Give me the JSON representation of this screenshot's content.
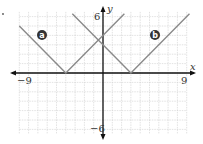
{
  "chart_data": {
    "type": "line",
    "title": "",
    "xlabel": "x",
    "ylabel": "y",
    "xlim": [
      -9,
      9
    ],
    "ylim": [
      -6,
      6
    ],
    "grid": true,
    "tick_labels": {
      "x_min": "−9",
      "x_max": "9",
      "y_max": "6",
      "y_min": "−6"
    },
    "series": [
      {
        "name": "a",
        "label": "a",
        "equation": "y = |x + 4|",
        "vertex": [
          -4,
          0
        ],
        "x": [
          -9,
          -4,
          2.3
        ],
        "y": [
          5,
          0,
          6.3
        ]
      },
      {
        "name": "b",
        "label": "b",
        "equation": "y = |x - 3|",
        "vertex": [
          3,
          0
        ],
        "x": [
          -3.3,
          3,
          9.3
        ],
        "y": [
          6.3,
          0,
          6.3
        ]
      }
    ],
    "colors": {
      "line": "#8a8a8a",
      "axis": "#111111",
      "grid": "#c8c8c8",
      "badge": "#333333"
    }
  }
}
